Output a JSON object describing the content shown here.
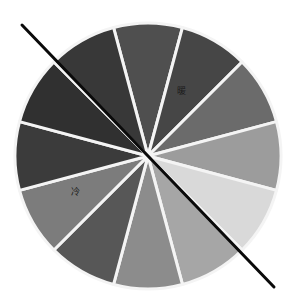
{
  "diagram": {
    "type": "color-wheel",
    "segments": 12,
    "center": [
      148,
      156
    ],
    "radius": 133,
    "segment_gap_color": "#f4f4f4",
    "segment_colors": [
      "#4f4f4f",
      "#464646",
      "#6b6b6b",
      "#9c9c9c",
      "#d9d9d9",
      "#a6a6a6",
      "#8c8c8c",
      "#575757",
      "#7c7c7c",
      "#3b3b3b",
      "#303030",
      "#383838"
    ],
    "divider": {
      "x1": 22,
      "y1": 25,
      "x2": 274,
      "y2": 287,
      "color": "#0a0a0a",
      "width": 3
    },
    "labels": {
      "warm": "暖",
      "cool": "冷"
    }
  },
  "caption": ""
}
